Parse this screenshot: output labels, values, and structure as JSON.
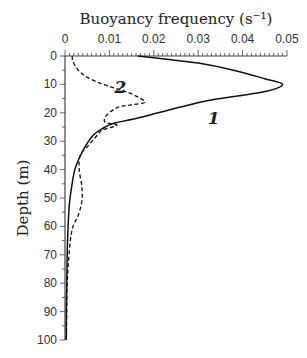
{
  "chart_data": {
    "type": "line",
    "title": "Buoyancy frequency (s⁻¹)",
    "xlabel": "Buoyancy frequency (s⁻¹)",
    "ylabel": "Depth (m)",
    "x_axis_position": "top",
    "y_inverted": true,
    "xlim": [
      0,
      0.05
    ],
    "ylim": [
      0,
      100
    ],
    "x_ticks": [
      "0",
      "0.01",
      "0.02",
      "0.03",
      "0.04",
      "0.05"
    ],
    "y_ticks": [
      "0",
      "10",
      "20",
      "30",
      "40",
      "50",
      "60",
      "70",
      "80",
      "90",
      "100"
    ],
    "grid": false,
    "legend": "inline labels",
    "series": [
      {
        "name": "1",
        "style": "solid",
        "points": [
          [
            0.0164,
            0
          ],
          [
            0.022,
            1
          ],
          [
            0.03,
            2.5
          ],
          [
            0.038,
            5
          ],
          [
            0.045,
            8
          ],
          [
            0.049,
            10
          ],
          [
            0.045,
            12.5
          ],
          [
            0.0326,
            15.6
          ],
          [
            0.026,
            18
          ],
          [
            0.021,
            20
          ],
          [
            0.016,
            22
          ],
          [
            0.011,
            23.7
          ],
          [
            0.0085,
            25.5
          ],
          [
            0.0063,
            28
          ],
          [
            0.0045,
            32
          ],
          [
            0.0032,
            36
          ],
          [
            0.0022,
            40
          ],
          [
            0.0015,
            46
          ],
          [
            0.001,
            52
          ],
          [
            0.0007,
            60
          ],
          [
            0.0005,
            70
          ],
          [
            0.0004,
            80
          ],
          [
            0.0003,
            90
          ],
          [
            0.0003,
            100
          ]
        ]
      },
      {
        "name": "2",
        "style": "dashed",
        "points": [
          [
            0.0016,
            0
          ],
          [
            0.0018,
            2
          ],
          [
            0.003,
            5
          ],
          [
            0.005,
            7.5
          ],
          [
            0.008,
            9.6
          ],
          [
            0.011,
            11.2
          ],
          [
            0.014,
            12.7
          ],
          [
            0.0165,
            14.5
          ],
          [
            0.018,
            16.3
          ],
          [
            0.015,
            17.2
          ],
          [
            0.012,
            18
          ],
          [
            0.0094,
            20.8
          ],
          [
            0.009,
            23.3
          ],
          [
            0.0117,
            24.4
          ],
          [
            0.0085,
            26
          ],
          [
            0.0075,
            27.5
          ],
          [
            0.0063,
            29.6
          ],
          [
            0.005,
            32
          ],
          [
            0.0034,
            35
          ],
          [
            0.0032,
            40
          ],
          [
            0.0038,
            46
          ],
          [
            0.0038,
            51
          ],
          [
            0.003,
            56
          ],
          [
            0.0018,
            60
          ],
          [
            0.0012,
            65
          ],
          [
            0.0008,
            72
          ],
          [
            0.0005,
            80
          ],
          [
            0.0004,
            90
          ],
          [
            0.0003,
            100
          ]
        ]
      }
    ],
    "annotations": [
      {
        "text": "1",
        "x": 0.0335,
        "y": 22
      },
      {
        "text": "2",
        "x": 0.0125,
        "y": 11
      }
    ]
  }
}
